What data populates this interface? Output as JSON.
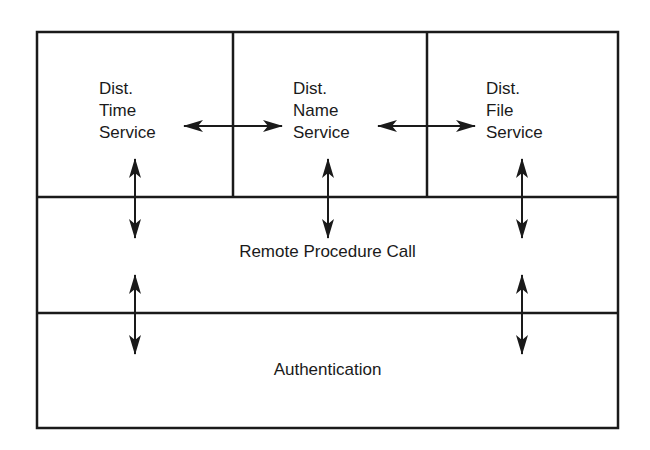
{
  "diagram": {
    "type": "layered-architecture",
    "services": [
      {
        "id": "time",
        "lines": [
          "Dist.",
          "Time",
          "Service"
        ]
      },
      {
        "id": "name",
        "lines": [
          "Dist.",
          "Name",
          "Service"
        ]
      },
      {
        "id": "file",
        "lines": [
          "Dist.",
          "File",
          "Service"
        ]
      }
    ],
    "layers": [
      {
        "id": "rpc",
        "label": "Remote Procedure Call"
      },
      {
        "id": "auth",
        "label": "Authentication"
      }
    ],
    "connections": [
      {
        "from": "time",
        "to": "name",
        "direction": "bidirectional",
        "orientation": "horizontal"
      },
      {
        "from": "name",
        "to": "file",
        "direction": "bidirectional",
        "orientation": "horizontal"
      },
      {
        "from": "time",
        "to": "rpc",
        "direction": "bidirectional",
        "orientation": "vertical"
      },
      {
        "from": "name",
        "to": "rpc",
        "direction": "bidirectional",
        "orientation": "vertical"
      },
      {
        "from": "file",
        "to": "rpc",
        "direction": "bidirectional",
        "orientation": "vertical"
      },
      {
        "from": "rpc",
        "to": "auth",
        "direction": "bidirectional",
        "orientation": "vertical",
        "position": "left"
      },
      {
        "from": "rpc",
        "to": "auth",
        "direction": "bidirectional",
        "orientation": "vertical",
        "position": "right"
      }
    ],
    "colors": {
      "line": "#1a1a1a",
      "background": "#ffffff"
    }
  }
}
